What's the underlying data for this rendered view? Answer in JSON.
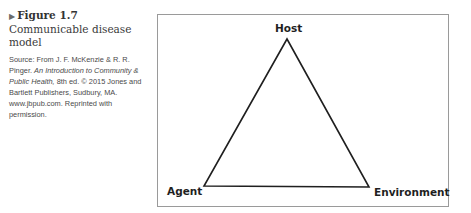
{
  "caption": {
    "arrow_icon": "▶",
    "figure_number": "Figure 1.7",
    "figure_title": "Communicable disease model",
    "source_prefix": "Source: From J. F. McKenzie & R. R. Pinger.",
    "source_book": "An Introduction to Community & Public Health,",
    "source_rest": "8th ed. © 2015 Jones and Bartlett Publishers, Sudbury, MA. www.jbpub.com. Reprinted with permission."
  },
  "diagram": {
    "type": "epidemiologic triangle",
    "vertices": {
      "top": "Host",
      "bottom_left": "Agent",
      "bottom_right": "Environment"
    },
    "colors": {
      "border": "#9a9a9a",
      "line": "#1f1f1f"
    }
  }
}
